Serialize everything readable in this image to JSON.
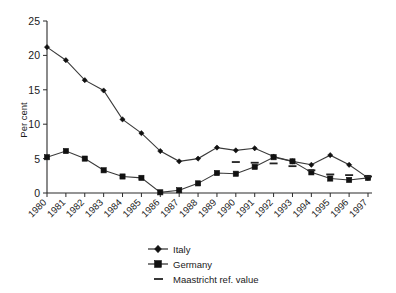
{
  "chart_data": {
    "type": "line",
    "title": "",
    "subtitle": "",
    "xlabel": "",
    "ylabel": "Per cent",
    "grid": false,
    "legend_position": "bottom-center",
    "xlim": [
      1980,
      1997
    ],
    "ylim": [
      0,
      25
    ],
    "ytick_labels": [
      "25",
      "20",
      "15",
      "10",
      "5",
      "0"
    ],
    "ytick_values": [
      25,
      20,
      15,
      10,
      5,
      0
    ],
    "categories": [
      "1980",
      "1981",
      "1982",
      "1983",
      "1984",
      "1985",
      "1986",
      "1987",
      "1988",
      "1989",
      "1990",
      "1991",
      "1992",
      "1993",
      "1994",
      "1995",
      "1996",
      "1997"
    ],
    "series": [
      {
        "name": "Italy",
        "marker": "diamond",
        "values": [
          21.2,
          19.3,
          16.4,
          14.9,
          10.7,
          8.7,
          6.1,
          4.6,
          5.0,
          6.6,
          6.2,
          6.5,
          5.3,
          4.6,
          4.1,
          5.5,
          4.1,
          2.2
        ]
      },
      {
        "name": "Germany",
        "marker": "square",
        "values": [
          5.2,
          6.1,
          5.0,
          3.3,
          2.4,
          2.2,
          0.1,
          0.4,
          1.4,
          2.9,
          2.8,
          3.8,
          5.2,
          4.6,
          3.0,
          2.1,
          1.9,
          2.2
        ]
      },
      {
        "name": "Maastricht ref. value",
        "marker": "dash",
        "values": [
          null,
          null,
          null,
          null,
          null,
          null,
          null,
          null,
          null,
          null,
          4.5,
          4.4,
          4.3,
          3.9,
          3.3,
          2.7,
          2.6,
          2.4
        ]
      }
    ]
  },
  "axes": {
    "ylabel": "Per cent"
  },
  "legend": {
    "items": [
      {
        "label": "Italy",
        "marker": "diamond"
      },
      {
        "label": "Germany",
        "marker": "square"
      },
      {
        "label": "Maastricht ref. value",
        "marker": "dash"
      }
    ]
  },
  "colors": {
    "ink": "#1a1a1a",
    "line": "#3a3a3a",
    "marker": "#111111",
    "background": "#ffffff"
  }
}
